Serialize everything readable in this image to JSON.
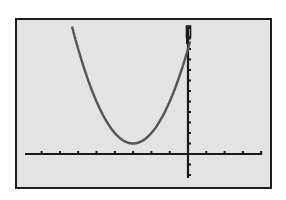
{
  "chart_data": {
    "type": "line",
    "title": "",
    "xlabel": "",
    "ylabel": "",
    "function": "y = (x + 3)^2 + 1",
    "series": [
      {
        "name": "Y1",
        "x": [
          -6.3,
          -6,
          -5,
          -4,
          -3,
          -2,
          -1,
          0,
          0.1
        ],
        "values": [
          11.9,
          10,
          5,
          2,
          1,
          2,
          5,
          10,
          10.6
        ]
      }
    ],
    "vertex": [
      -3,
      1
    ],
    "xlim": [
      -9,
      4
    ],
    "ylim": [
      -2.3,
      12
    ],
    "xscale": 1,
    "yscale": 1,
    "grid": false,
    "legend": "none",
    "colors": {
      "screen_bg": "#e3e3e3",
      "border": "#1e1e1e",
      "axes": "#1a1a1a",
      "curve": "#555555"
    }
  },
  "calculator": {
    "cursor_visible": true
  }
}
